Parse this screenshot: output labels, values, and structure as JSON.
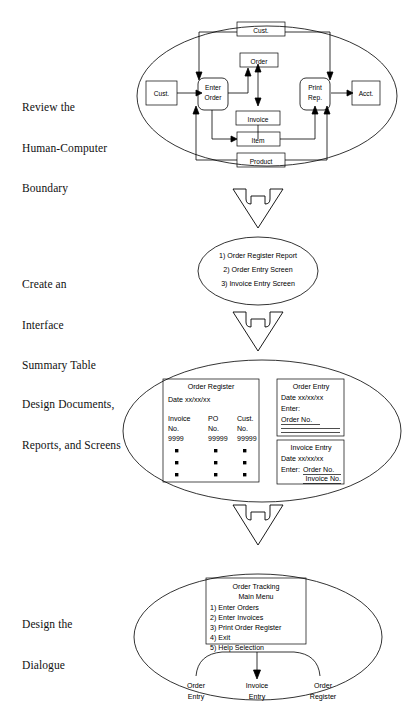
{
  "stages": [
    {
      "id": "review-boundary",
      "label": "Review the\nHuman-Computer\nBoundary",
      "line1": "Review the",
      "line2": "Human-Computer",
      "line3": "Boundary"
    },
    {
      "id": "interface-summary",
      "label": "Create an\nInterface\nSummary Table",
      "line1": "Create an",
      "line2": "Interface",
      "line3": "Summary Table"
    },
    {
      "id": "design-documents",
      "label": "Design Documents,\nReports, and Screens",
      "line1": "Design Documents,",
      "line2": "Reports, and Screens",
      "line3": ""
    },
    {
      "id": "design-dialogue",
      "label": "Design the\nDialogue",
      "line1": "Design the",
      "line2": "Dialogue",
      "line3": ""
    }
  ],
  "dfd": {
    "external_left": "Cust.",
    "external_right": "Acct.",
    "process_left_line1": "Enter",
    "process_left_line2": "Order",
    "process_right_line1": "Print",
    "process_right_line2": "Rep.",
    "store_top": "Cust.",
    "store_order": "Order",
    "store_invoice": "Invoice",
    "store_item": "Item",
    "store_product": "Product"
  },
  "summary_list": {
    "item1": "1) Order Register Report",
    "item2": "2) Order Entry Screen",
    "item3": "3) Invoice Entry Screen"
  },
  "order_register": {
    "title": "Order Register",
    "date": "Date xx/xx/xx",
    "col1_header1": "Invoice",
    "col1_header2": "No.",
    "col1_value": "9999",
    "col2_header1": "PO",
    "col2_header2": "No.",
    "col2_value": "99999",
    "col3_header1": "Cust.",
    "col3_header2": "No.",
    "col3_value": "99999"
  },
  "order_entry": {
    "title": "Order Entry",
    "date": "Date xx/xx/xx",
    "enter_label": "Enter:",
    "field1": "Order No."
  },
  "invoice_entry": {
    "title": "Invoice Entry",
    "date": "Date xx/xx/xx",
    "enter_label": "Enter:",
    "field1": "Order No.",
    "field2": "Invoice No."
  },
  "main_menu": {
    "title_line1": "Order Tracking",
    "title_line2": "Main Menu",
    "option1": "1) Enter Orders",
    "option2": "2) Enter Invoices",
    "option3": "3) Print Order Register",
    "option4": "4) Exit",
    "option5": "5) Help Selection"
  },
  "dialogue_branches": {
    "left_line1": "Order",
    "left_line2": "Entry",
    "mid_line1": "Invoice",
    "mid_line2": "Entry",
    "right_line1": "Order",
    "right_line2": "Register"
  }
}
